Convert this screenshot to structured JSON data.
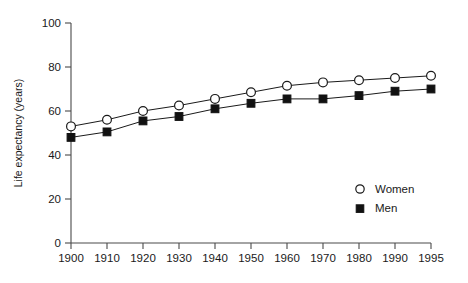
{
  "chart_data": {
    "type": "line",
    "title": "",
    "subtitle": "",
    "xlabel": "",
    "ylabel": "Life expectancy (years)",
    "x": [
      1900,
      1910,
      1920,
      1930,
      1940,
      1950,
      1960,
      1970,
      1980,
      1990,
      1995
    ],
    "xtick_labels": [
      "1900",
      "1910",
      "1920",
      "1930",
      "1940",
      "1950",
      "1960",
      "1970",
      "1980",
      "1990",
      "1995"
    ],
    "ytick_labels": [
      "0",
      "20",
      "40",
      "60",
      "80",
      "100"
    ],
    "yticks": [
      0,
      20,
      40,
      60,
      80,
      100
    ],
    "ylim": [
      0,
      100
    ],
    "xlim": [
      1900,
      1995
    ],
    "grid": false,
    "legend_position": "bottom-right",
    "series": [
      {
        "name": "Women",
        "marker": "open-circle",
        "color": "#111111",
        "values": [
          53,
          56,
          60,
          62.5,
          65.5,
          68.5,
          71.5,
          73,
          74,
          75,
          76
        ]
      },
      {
        "name": "Men",
        "marker": "filled-square",
        "color": "#111111",
        "values": [
          48,
          50.5,
          55.5,
          57.5,
          61,
          63.5,
          65.5,
          65.5,
          67,
          69,
          70
        ]
      }
    ],
    "legend": [
      {
        "label": "Women",
        "marker": "open-circle"
      },
      {
        "label": "Men",
        "marker": "filled-square"
      }
    ]
  }
}
